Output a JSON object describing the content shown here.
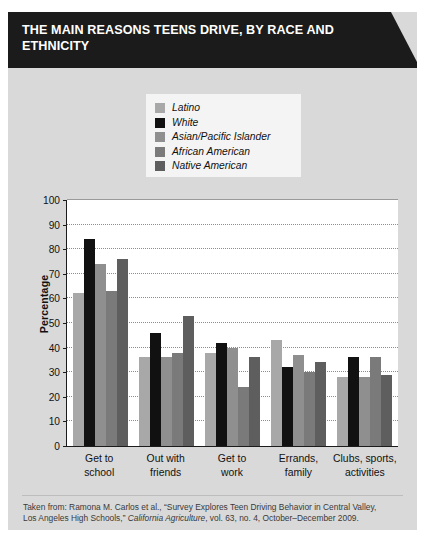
{
  "header": {
    "title": "THE MAIN REASONS TEENS DRIVE, BY RACE AND ETHNICITY"
  },
  "colors": {
    "latino": "#a8a8a8",
    "white": "#111111",
    "asian_pacific_islander": "#8f8f8f",
    "african_american": "#7a7a7a",
    "native_american": "#5e5e5e",
    "banner_bg": "#1b1b1b",
    "card_bg": "#d9d9d9",
    "plot_bg": "#ffffff",
    "legend_bg": "#f4f4f4",
    "axis": "#1b1b1b",
    "gridline": "#8d8d8d"
  },
  "footer": {
    "line1_prefix": "Taken from: Ramona M. Carlos et al., “Survey Explores Teen Driving Behavior in Central Valley,",
    "line2_prefix": "Los Angeles High Schools,” ",
    "line2_italic": "California Agriculture",
    "line2_suffix": ", vol. 63, no. 4, October–December 2009."
  },
  "chart_data": {
    "type": "bar",
    "title": "THE MAIN REASONS TEENS DRIVE, BY RACE AND ETHNICITY",
    "xlabel": "",
    "ylabel": "Percentage",
    "ylim": [
      0,
      100
    ],
    "yticks": [
      0,
      10,
      20,
      30,
      40,
      50,
      60,
      70,
      80,
      90,
      100
    ],
    "grid": true,
    "legend_position": "top-center",
    "categories": [
      "Get to school",
      "Out with friends",
      "Get to work",
      "Errands, family",
      "Clubs, sports, activities"
    ],
    "category_lines": [
      [
        "Get to",
        "school"
      ],
      [
        "Out with",
        "friends"
      ],
      [
        "Get to",
        "work"
      ],
      [
        "Errands,",
        "family"
      ],
      [
        "Clubs, sports,",
        "activities"
      ]
    ],
    "series": [
      {
        "name": "Latino",
        "color": "#a8a8a8",
        "values": [
          62,
          36,
          38,
          43,
          28
        ]
      },
      {
        "name": "White",
        "color": "#111111",
        "values": [
          84,
          46,
          42,
          32,
          36
        ]
      },
      {
        "name": "Asian/Pacific Islander",
        "color": "#8f8f8f",
        "values": [
          74,
          36,
          40,
          37,
          28
        ]
      },
      {
        "name": "African American",
        "color": "#7a7a7a",
        "values": [
          63,
          38,
          24,
          30,
          36
        ]
      },
      {
        "name": "Native American",
        "color": "#5e5e5e",
        "values": [
          76,
          53,
          36,
          34,
          29
        ]
      }
    ]
  }
}
